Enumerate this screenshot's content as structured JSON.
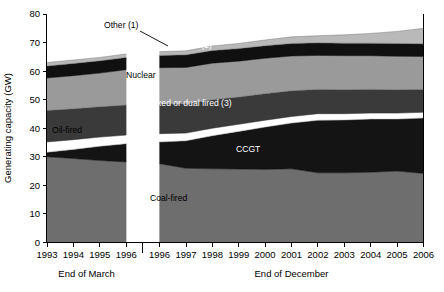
{
  "chart_data": {
    "type": "area",
    "title": "",
    "xlabel": "",
    "ylabel": "Generating capacity (GW)",
    "ylim": [
      0,
      80
    ],
    "yticks": [
      0,
      10,
      20,
      30,
      40,
      50,
      60,
      70,
      80
    ],
    "grid": false,
    "legend_position": "inline-annotations",
    "stacked": true,
    "axis_break": {
      "present": true,
      "between": [
        "1996 (End of March)",
        "1996 (End of December)"
      ]
    },
    "x_segments": [
      {
        "label": "End of March",
        "categories": [
          "1993",
          "1994",
          "1995",
          "1996"
        ]
      },
      {
        "label": "End of December",
        "categories": [
          "1996",
          "1997",
          "1998",
          "1999",
          "2000",
          "2001",
          "2002",
          "2003",
          "2004",
          "2005",
          "2006"
        ]
      }
    ],
    "categories": [
      "1993",
      "1994",
      "1995",
      "1996",
      "1996",
      "1997",
      "1998",
      "1999",
      "2000",
      "2001",
      "2002",
      "2003",
      "2004",
      "2005",
      "2006"
    ],
    "series": [
      {
        "name": "Coal-fired",
        "color": "#6e6e6e",
        "label_color": "#2b2b2b",
        "values": [
          30.0,
          29.4,
          28.7,
          28.2,
          27.6,
          26.0,
          25.8,
          25.7,
          25.6,
          25.8,
          24.4,
          24.4,
          24.6,
          25.0,
          24.2
        ]
      },
      {
        "name": "CCGT",
        "color": "#141414",
        "label_color": "#ffffff",
        "values": [
          1.6,
          3.2,
          5.0,
          6.4,
          7.6,
          9.6,
          11.6,
          13.2,
          14.8,
          16.0,
          18.4,
          18.5,
          18.6,
          18.2,
          19.4
        ]
      },
      {
        "name": "Oil-fired",
        "color": "#ffffff",
        "label_color": "#000000",
        "values": [
          3.6,
          3.4,
          3.2,
          3.0,
          2.9,
          2.7,
          2.6,
          2.5,
          2.4,
          2.3,
          2.3,
          2.2,
          2.1,
          2.1,
          2.0
        ]
      },
      {
        "name": "Mixed or dual fired (3)",
        "color": "#3a3a3a",
        "label_color": "#ffffff",
        "values": [
          11.0,
          10.8,
          10.6,
          10.5,
          10.4,
          10.2,
          10.0,
          9.5,
          9.3,
          9.0,
          8.5,
          8.4,
          8.3,
          8.2,
          8.0
        ]
      },
      {
        "name": "Nuclear",
        "color": "#9a9a9a",
        "label_color": "#1a1a1a",
        "values": [
          11.4,
          11.6,
          11.8,
          12.4,
          12.7,
          12.8,
          12.8,
          12.6,
          12.4,
          12.2,
          11.9,
          11.9,
          11.8,
          11.7,
          11.5
        ]
      },
      {
        "name": "Hydro (2)",
        "color": "#101010",
        "label_color": "#ffffff",
        "values": [
          4.2,
          4.3,
          4.3,
          4.3,
          4.3,
          4.4,
          4.4,
          4.4,
          4.4,
          4.4,
          4.4,
          4.4,
          4.4,
          4.5,
          4.5
        ]
      },
      {
        "name": "Other (1)",
        "color": "#b9b9b9",
        "label_color": "#000000",
        "values": [
          1.2,
          1.2,
          1.2,
          1.2,
          1.3,
          1.4,
          1.6,
          1.8,
          2.0,
          2.3,
          2.5,
          2.9,
          3.4,
          4.2,
          5.4
        ]
      }
    ],
    "annotations": [
      {
        "text": "Other (1)",
        "kind": "leader-callout",
        "target_series": "Other (1)"
      },
      {
        "text": "Hydro (2)",
        "kind": "inline",
        "target_series": "Hydro (2)"
      },
      {
        "text": "Nuclear",
        "kind": "inline",
        "target_series": "Nuclear"
      },
      {
        "text": "Mixed or dual fired (3)",
        "kind": "inline",
        "target_series": "Mixed or dual fired (3)"
      },
      {
        "text": "Oil-fired",
        "kind": "inline",
        "target_series": "Oil-fired"
      },
      {
        "text": "CCGT",
        "kind": "inline",
        "target_series": "CCGT"
      },
      {
        "text": "Coal-fired",
        "kind": "inline",
        "target_series": "Coal-fired"
      }
    ]
  },
  "axis": {
    "y_title": "Generating capacity (GW)",
    "y_tick_labels": [
      "0",
      "10",
      "20",
      "30",
      "40",
      "50",
      "60",
      "70",
      "80"
    ],
    "x_tick_labels": [
      "1993",
      "1994",
      "1995",
      "1996",
      "1996",
      "1997",
      "1998",
      "1999",
      "2000",
      "2001",
      "2002",
      "2003",
      "2004",
      "2005",
      "2006"
    ],
    "period_left": "End of March",
    "period_right": "End of December"
  },
  "band_labels": {
    "other": "Other (1)",
    "hydro": "Hydro (2)",
    "nuclear": "Nuclear",
    "mixed": "Mixed or dual fired (3)",
    "oil": "Oil-fired",
    "ccgt": "CCGT",
    "coal": "Coal-fired"
  },
  "colors": {
    "coal": "#6e6e6e",
    "ccgt": "#141414",
    "oil": "#ffffff",
    "mixed": "#3a3a3a",
    "nuclear": "#9a9a9a",
    "hydro": "#101010",
    "other": "#b9b9b9",
    "axis": "#000000",
    "background": "#ffffff"
  }
}
